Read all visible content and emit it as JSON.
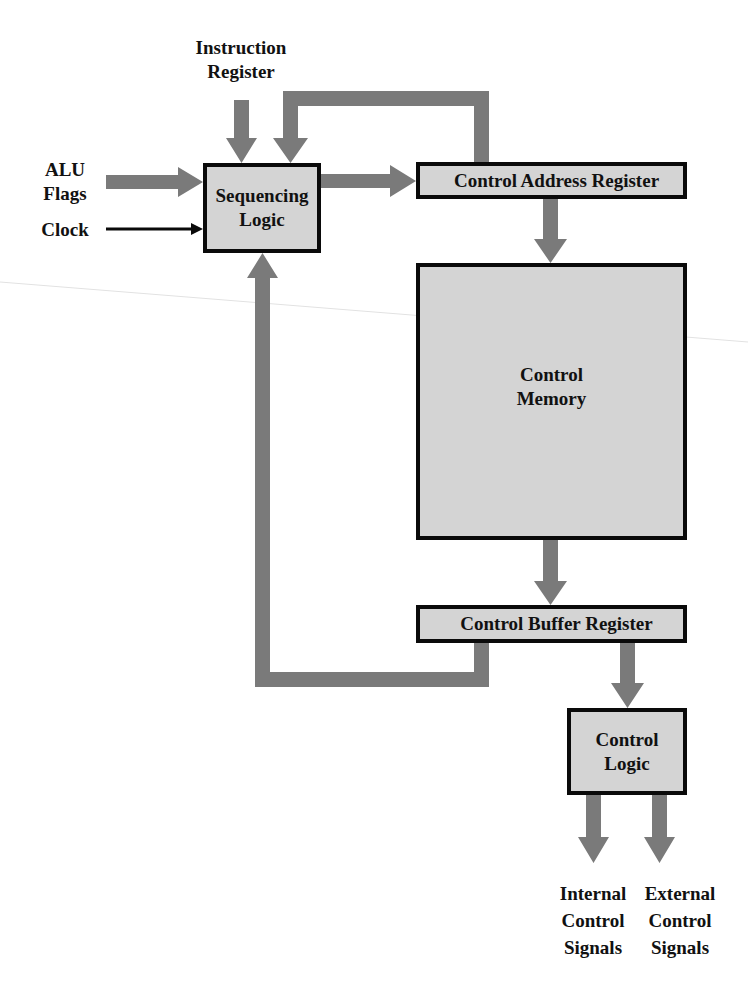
{
  "diagram": {
    "colors": {
      "arrow": "#7a7a7a",
      "box_fill": "#d4d4d4",
      "box_border": "#0a0a0a",
      "text": "#111111",
      "background": "#ffffff"
    },
    "inputs": {
      "instruction_register": {
        "line1": "Instruction",
        "line2": "Register"
      },
      "alu_flags": {
        "line1": "ALU",
        "line2": "Flags"
      },
      "clock": "Clock"
    },
    "blocks": {
      "sequencing_logic": {
        "line1": "Sequencing",
        "line2": "Logic"
      },
      "control_address_register": "Control Address Register",
      "control_memory": {
        "line1": "Control",
        "line2": "Memory"
      },
      "control_buffer_register": "Control Buffer Register",
      "control_logic": {
        "line1": "Control",
        "line2": "Logic"
      }
    },
    "outputs": {
      "internal": {
        "line1": "Internal",
        "line2": "Control",
        "line3": "Signals"
      },
      "external": {
        "line1": "External",
        "line2": "Control",
        "line3": "Signals"
      }
    },
    "connections": [
      {
        "from": "Instruction Register",
        "to": "Sequencing Logic"
      },
      {
        "from": "ALU Flags",
        "to": "Sequencing Logic"
      },
      {
        "from": "Clock",
        "to": "Sequencing Logic"
      },
      {
        "from": "Sequencing Logic",
        "to": "Control Address Register"
      },
      {
        "from": "Control Address Register",
        "to": "Sequencing Logic"
      },
      {
        "from": "Control Address Register",
        "to": "Control Memory"
      },
      {
        "from": "Control Memory",
        "to": "Control Buffer Register"
      },
      {
        "from": "Control Buffer Register",
        "to": "Sequencing Logic"
      },
      {
        "from": "Control Buffer Register",
        "to": "Control Logic"
      },
      {
        "from": "Control Logic",
        "to": "Internal Control Signals"
      },
      {
        "from": "Control Logic",
        "to": "External Control Signals"
      }
    ]
  }
}
